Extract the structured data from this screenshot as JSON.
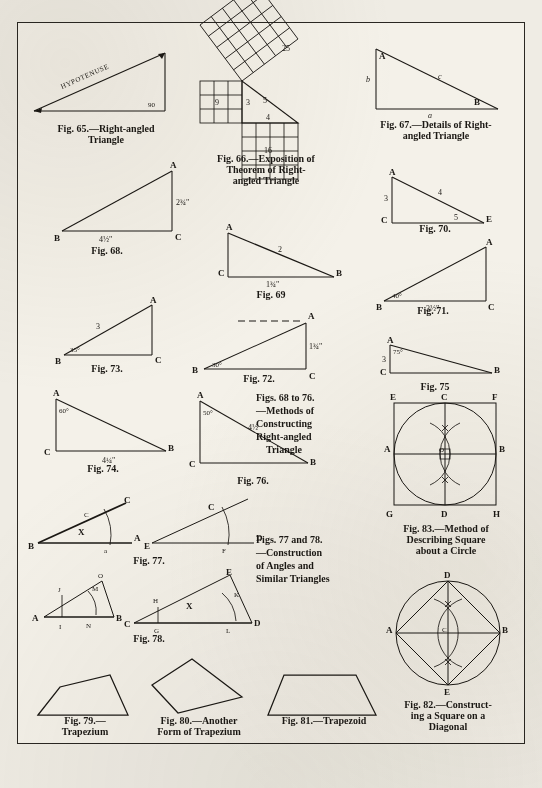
{
  "page": {
    "ink_color": "#1b1814",
    "paper_color": "#f4f1e9"
  },
  "figures": {
    "fig65": {
      "caption_line1": "Fig.  65.—Right-angled",
      "caption_line2": "Triangle",
      "hypotenuse_label": "HYPOTENUSE",
      "right_angle_label": "90"
    },
    "fig66": {
      "caption_line1": "Fig. 66.—Exposition of",
      "caption_line2": "Theorem of Right-",
      "caption_line3": "angled Triangle",
      "square_a": "9",
      "square_b": "16",
      "square_c": "25",
      "side_a": "3",
      "side_b": "4",
      "side_c": "5"
    },
    "fig67": {
      "caption_line1": "Fig. 67.—Details of Right-",
      "caption_line2": "angled Triangle",
      "vertex_a": "A",
      "vertex_b": "B",
      "side_b": "b",
      "side_a": "a",
      "side_c": "c"
    },
    "fig68": {
      "caption": "Fig. 68.",
      "vertex_a": "A",
      "vertex_b": "B",
      "vertex_c": "C",
      "base_label": "4½\"",
      "height_label": "2¾\""
    },
    "fig69": {
      "caption": "Fig. 69",
      "vertex_a": "A",
      "vertex_b": "B",
      "vertex_c": "C",
      "hyp_label": "2",
      "base_label": "1¾\""
    },
    "fig70": {
      "caption": "Fig. 70.",
      "vertex_a": "A",
      "vertex_c": "C",
      "vertex_e": "E",
      "side_left": "3",
      "side_hyp": "4",
      "side_base": "5"
    },
    "fig71": {
      "caption": "Fig. 71.",
      "vertex_a": "A",
      "vertex_b": "B",
      "vertex_c": "C",
      "angle_label": "40°",
      "base_label": "3½\""
    },
    "fig72": {
      "caption": "Fig. 72.",
      "vertex_a": "A",
      "vertex_b": "B",
      "vertex_c": "C",
      "angle_label": "30°",
      "height_label": "1¾\""
    },
    "fig73": {
      "caption": "Fig. 73.",
      "vertex_a": "A",
      "vertex_b": "B",
      "vertex_c": "C",
      "angle_label": "35°",
      "hyp_label": "3"
    },
    "fig74": {
      "caption": "Fig. 74.",
      "vertex_a": "A",
      "vertex_b": "B",
      "vertex_c": "C",
      "angle_label": "60°",
      "base_label": "4¼\""
    },
    "fig75": {
      "caption": "Fig. 75",
      "vertex_a": "A",
      "vertex_b": "B",
      "vertex_c": "C",
      "angle_label": "75°",
      "side_label": "3"
    },
    "fig76": {
      "caption": "Fig. 76.",
      "vertex_a": "A",
      "vertex_b": "B",
      "vertex_c": "C",
      "angle_label": "50°",
      "hyp_label": "4½"
    },
    "fig77": {
      "caption": "Fig. 77.",
      "left_b": "B",
      "left_c_inner": "C",
      "left_c_outer": "C",
      "left_a": "A",
      "left_a_small": "a",
      "left_x": "X",
      "right_e": "E",
      "right_c": "C",
      "right_d": "D",
      "right_f": "F"
    },
    "fig78": {
      "caption": "Fig. 78.",
      "a": "A",
      "j": "J",
      "i": "I",
      "o": "O",
      "m": "M",
      "n": "N",
      "b": "B",
      "c": "C",
      "h": "H",
      "g": "G",
      "l": "L",
      "d": "D",
      "k": "K",
      "e": "E",
      "x": "X"
    },
    "fig79": {
      "caption_line1": "Fig. 79.—",
      "caption_line2": "Trapezium"
    },
    "fig80": {
      "caption_line1": "Fig. 80.—Another",
      "caption_line2": "Form of Trapezium"
    },
    "fig81": {
      "caption": "Fig. 81.—Trapezoid"
    },
    "fig82": {
      "caption_line1": "Fig. 82.—Construct-",
      "caption_line2": "ing a Square on a",
      "caption_line3": "Diagonal",
      "a": "A",
      "b": "B",
      "c_center": "C",
      "d": "D",
      "e": "E"
    },
    "fig83": {
      "caption_line1": "Fig. 83.—Method of",
      "caption_line2": "Describing Square",
      "caption_line3": "about a Circle",
      "e": "E",
      "c": "C",
      "f": "F",
      "a": "A",
      "o": "O",
      "b": "B",
      "g": "G",
      "d": "D",
      "h": "H"
    }
  },
  "text_blocks": {
    "block_68_76": {
      "line1": "Figs. 68 to 76.",
      "line2": "—Methods of",
      "line3": "Constructing",
      "line4": "Right-angled",
      "line5": "Triangle"
    },
    "block_77_78": {
      "line1": "Figs. 77 and 78.",
      "line2": "—Construction",
      "line3": "of Angles and",
      "line4": "Similar Triangles"
    }
  }
}
